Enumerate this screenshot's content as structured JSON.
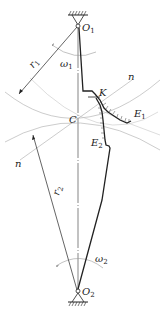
{
  "diagram": {
    "type": "gear-meshing-cam-profile",
    "labels": {
      "O1": {
        "main": "O",
        "sub": "1"
      },
      "O2": {
        "main": "O",
        "sub": "2"
      },
      "omega1": {
        "main": "ω",
        "sub": "1"
      },
      "omega2": {
        "main": "ω",
        "sub": "2"
      },
      "r1": {
        "main": "r",
        "sub": "1"
      },
      "r2": {
        "main": "r",
        "sub": "2"
      },
      "C": "C",
      "K": "K",
      "E1": {
        "main": "E",
        "sub": "1"
      },
      "E2": {
        "main": "E",
        "sub": "2"
      },
      "n_top": "n",
      "n_left": "n"
    },
    "colors": {
      "stroke": "#222222",
      "thin": "#aaaaaa",
      "text": "#222222"
    }
  }
}
